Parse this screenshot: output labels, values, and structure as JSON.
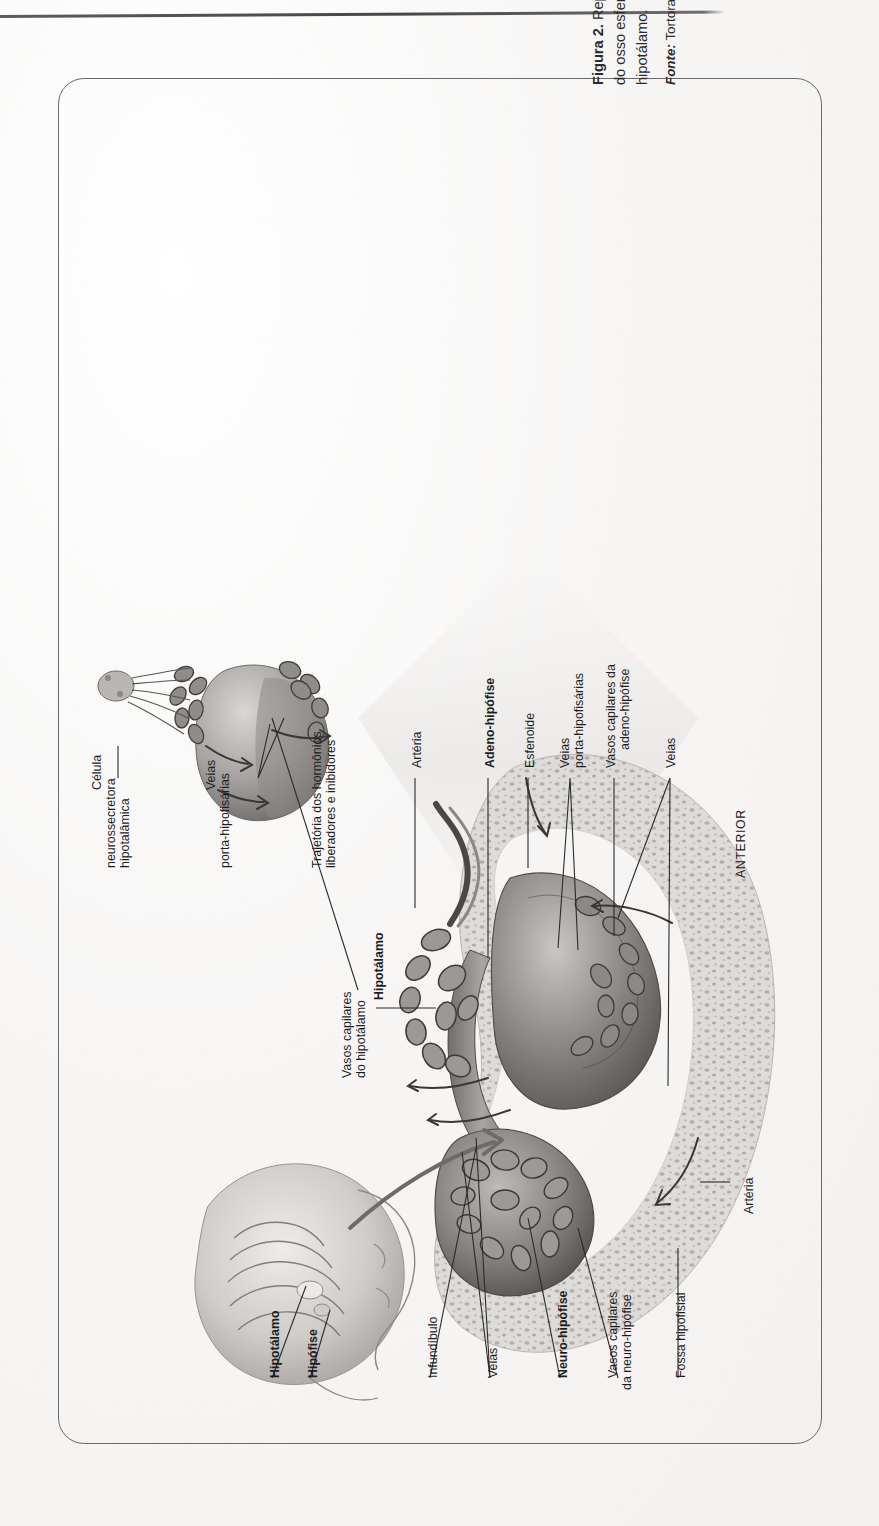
{
  "page": {
    "running_head": "",
    "background_color": "#fbfafa"
  },
  "figure": {
    "caption_prefix": "Figura 2.",
    "caption_text": " Representação da glândula hipófise alojada na sela turca do osso esfenoide e relação anatômica da adeno-hipófise com o hipotálamo.",
    "source_prefix": "Fonte:",
    "source_text": " Tortora e Derrickson (2017, p. 328)."
  },
  "labels": {
    "celula": "Célula\nneurossecretora\nhipotalâmica",
    "celula_l1": "Célula",
    "celula_l2": "neurossecretora",
    "celula_l3": "hipotalâmica",
    "veias_porta_top_l1": "Veias",
    "veias_porta_top_l2": "porta-hipofisárias",
    "trajetoria_l1": "Trajetória dos hormônios",
    "trajetoria_l2": "liberadores e inibidores",
    "arteria_top": "Artéria",
    "adeno_hipofise": "Adeno-hipófise",
    "esfenoide": "Esfenoide",
    "veias_porta_l1": "Veias",
    "veias_porta_l2": "porta-hipofisárias",
    "vasos_adeno_l1": "Vasos capilares da",
    "vasos_adeno_l2": "adeno-hipófise",
    "veias_right": "Veias",
    "anterior": "ANTERIOR",
    "vasos_hipotalamo_l1": "Vasos capilares",
    "vasos_hipotalamo_l2": "do hipotálamo",
    "hipotalamo_mid": "Hipotálamo",
    "hipotalamo_bottom": "Hipotálamo",
    "hipofise_bottom": "Hipófise",
    "infundibulo": "Infundíbulo",
    "veias_bottom": "Veias",
    "neuro_hipofise": "Neuro-hipófise",
    "vasos_neuro_l1": "Vasos capilares",
    "vasos_neuro_l2": "da neuro-hipófise",
    "fossa_hipofisial": "Fossa hipofisial",
    "arteria_bottom": "Artéria"
  },
  "colors": {
    "frame_border": "#6a6a6a",
    "text": "#1d1d1d",
    "caption_text": "#2b2b2b",
    "rule": "#4e4e4e",
    "illustration_mid": "#9a9a9a",
    "illustration_dark": "#5a5a5a",
    "illustration_light": "#d8d6d4"
  }
}
